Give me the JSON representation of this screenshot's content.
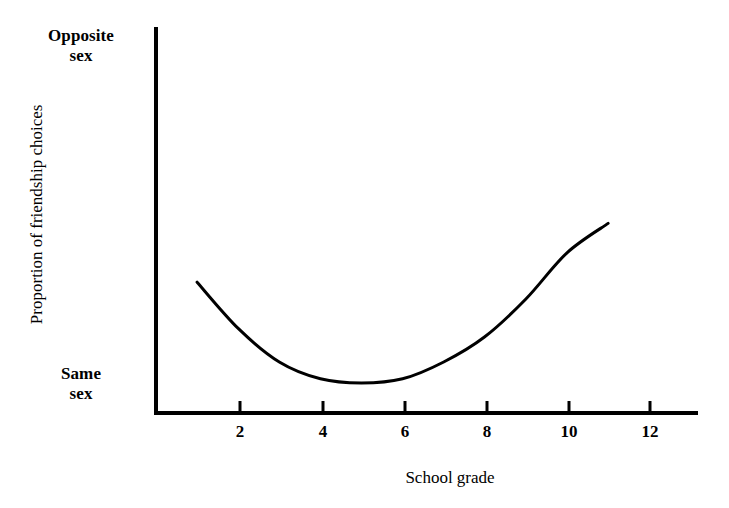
{
  "figure": {
    "background_color": "#ffffff",
    "ink_color": "#000000"
  },
  "chart_data": {
    "type": "line",
    "title": "",
    "subtitle": "",
    "xlabel": "School grade",
    "ylabel": "Proportion of friendship choices",
    "grid": false,
    "legend": null,
    "legend_position": "none",
    "xlim": [
      1,
      13
    ],
    "ylim": [
      0,
      1
    ],
    "xticks": [
      2,
      4,
      6,
      8,
      10,
      12
    ],
    "xticklabels": [
      "2",
      "4",
      "6",
      "8",
      "10",
      "12"
    ],
    "yticks": [
      0,
      1
    ],
    "yticklabels": [
      "Same\nsex",
      "Opposite\nsex"
    ],
    "y_axis_low_label_line1": "Same",
    "y_axis_low_label_line2": "sex",
    "y_axis_high_label_line1": "Opposite",
    "y_axis_high_label_line2": "sex",
    "series": [
      {
        "name": "Proportion of opposite-sex friendship choices",
        "style": "smooth-curve",
        "color": "#000000",
        "line_width": 3,
        "x": [
          2,
          3,
          4,
          5,
          6,
          7,
          8,
          9,
          10,
          11,
          12
        ],
        "y": [
          0.43,
          0.32,
          0.24,
          0.2,
          0.19,
          0.2,
          0.24,
          0.3,
          0.39,
          0.5,
          0.57
        ],
        "annotation": "U-shaped curve: opposite-sex friendship choices decline from grade 2 to a minimum near grade 6, then rise steadily through grade 12."
      }
    ]
  },
  "xtick_labels": [
    {
      "text": "2",
      "x_px": 240
    },
    {
      "text": "4",
      "x_px": 323
    },
    {
      "text": "6",
      "x_px": 405
    },
    {
      "text": "8",
      "x_px": 487
    },
    {
      "text": "10",
      "x_px": 569
    },
    {
      "text": "12",
      "x_px": 650
    }
  ]
}
